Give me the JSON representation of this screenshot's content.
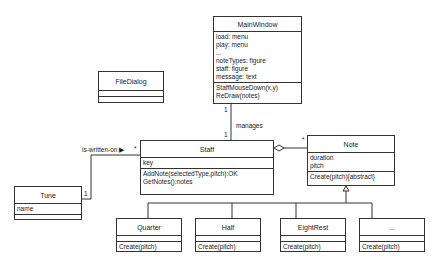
{
  "classes": {
    "main_window": {
      "name": "MainWindow",
      "attributes": [
        "load: menu",
        "play: menu",
        "...",
        "noteTypes: figure",
        "staff: figure",
        "message: text"
      ],
      "operations": [
        "StaffMouseDown(x,y)",
        "ReDraw(notes)"
      ]
    },
    "file_dialog": {
      "name": "FileDialog",
      "attributes": [],
      "operations": []
    },
    "staff": {
      "name": "Staff",
      "attributes": [
        "key"
      ],
      "operations": [
        "AddNote(selectedType,pitch):OK",
        "GetNotes():notes"
      ]
    },
    "note": {
      "name": "Note",
      "attributes": [
        "duration",
        "pitch"
      ],
      "operations": [
        "Create(pitch){abstract}"
      ]
    },
    "tune": {
      "name": "Tune",
      "attributes": [
        "name"
      ],
      "operations": []
    },
    "quarter": {
      "name": "Quarter",
      "attributes": [],
      "operations": [
        "Create(pitch)"
      ]
    },
    "half": {
      "name": "Half",
      "attributes": [],
      "operations": [
        "Create(pitch)"
      ]
    },
    "eight_rest": {
      "name": "EightRest",
      "attributes": [],
      "operations": [
        "Create(pitch)"
      ]
    },
    "more": {
      "name": "...",
      "attributes": [],
      "operations": [
        "Create(pitch)"
      ]
    }
  },
  "associations": {
    "manages": {
      "label": "manages",
      "mult_main": "1",
      "mult_staff": "1"
    },
    "is_written_on": {
      "label": "is-written-on ▶",
      "mult_staff": "*",
      "mult_tune": "1"
    },
    "staff_note": {
      "mult_note": "*"
    }
  }
}
